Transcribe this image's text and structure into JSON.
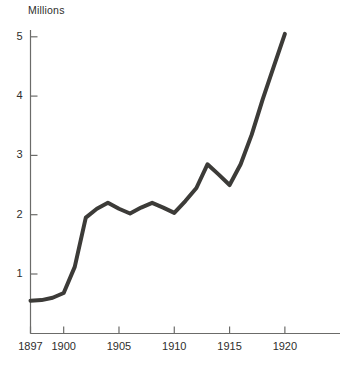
{
  "chart_data": {
    "type": "line",
    "title": "",
    "ylabel": "Millions",
    "xlabel": "",
    "grid": false,
    "legend": false,
    "axis_color": "#6b6b69",
    "line_color": "#3c3b38",
    "line_width": 4,
    "xlim": [
      1897,
      1923
    ],
    "ylim": [
      0,
      5.6
    ],
    "yticks": [
      1,
      2,
      3,
      4,
      5
    ],
    "ytick_labels": [
      "1",
      "2",
      "3",
      "4",
      "5"
    ],
    "xticks": [
      1897,
      1900,
      1905,
      1910,
      1915,
      1920
    ],
    "xtick_labels": [
      "1897",
      "1900",
      "1905",
      "1910",
      "1915",
      "1920"
    ],
    "x": [
      1897,
      1898,
      1899,
      1900,
      1901,
      1902,
      1903,
      1904,
      1905,
      1906,
      1907,
      1908,
      1909,
      1910,
      1911,
      1912,
      1913,
      1914,
      1915,
      1916,
      1917,
      1918,
      1919,
      1920
    ],
    "values": [
      0.55,
      0.56,
      0.6,
      0.68,
      1.12,
      1.95,
      2.1,
      2.2,
      2.1,
      2.02,
      2.12,
      2.2,
      2.12,
      2.03,
      2.23,
      2.45,
      2.85,
      2.68,
      2.5,
      2.85,
      3.35,
      3.95,
      4.5,
      5.05
    ],
    "series": [
      {
        "name": "Millions",
        "values": [
          0.55,
          0.56,
          0.6,
          0.68,
          1.12,
          1.95,
          2.1,
          2.2,
          2.1,
          2.02,
          2.12,
          2.2,
          2.12,
          2.03,
          2.23,
          2.45,
          2.85,
          2.68,
          2.5,
          2.85,
          3.35,
          3.95,
          4.5,
          5.05
        ]
      }
    ]
  }
}
